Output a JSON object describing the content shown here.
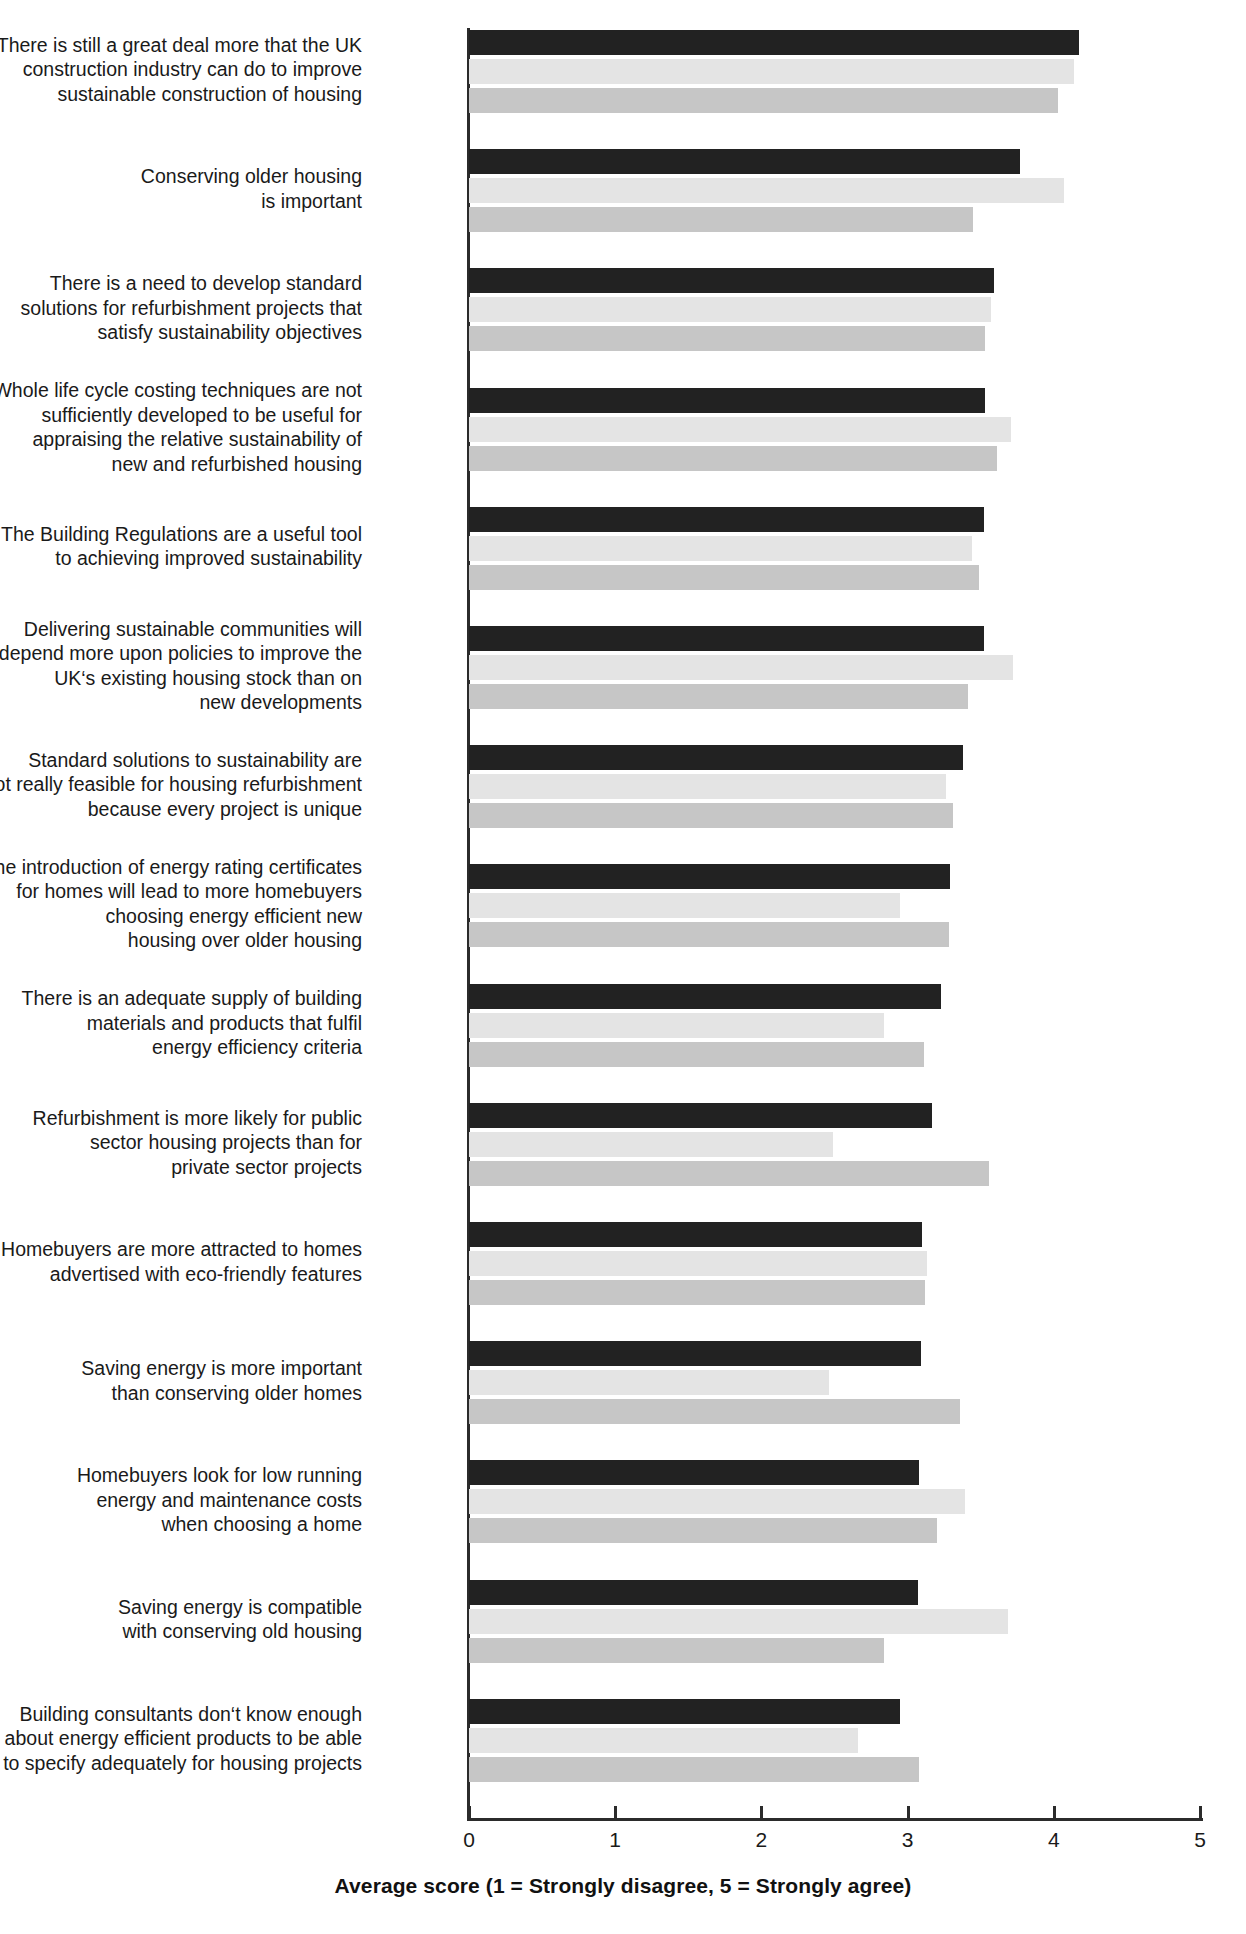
{
  "chart_data": {
    "type": "bar",
    "orientation": "horizontal",
    "title": "",
    "xlabel": "Average score (1 = Strongly disagree, 5 = Strongly agree)",
    "ylabel": "",
    "xlim": [
      0,
      5
    ],
    "xticks": [
      "0",
      "1",
      "2",
      "3",
      "4",
      "5"
    ],
    "grid": false,
    "legend": "none",
    "categories": [
      "There is still a great deal more that the UK\nconstruction industry can do to improve\nsustainable construction of housing",
      "Conserving older housing\nis important",
      "There is a need to develop standard\nsolutions for refurbishment projects that\nsatisfy sustainability objectives",
      "Whole life cycle costing techniques are not\nsufficiently developed to be useful for\nappraising the relative sustainability of\nnew and refurbished housing",
      "The Building Regulations are a useful tool\nto achieving improved sustainability",
      "Delivering sustainable communities will\ndepend more upon policies to improve the\nUK‘s existing housing stock than on\nnew developments",
      "Standard solutions to sustainability are\nnot really feasible for housing refurbishment\nbecause every project is unique",
      "The introduction of energy rating certificates\nfor homes will lead to more homebuyers\nchoosing energy efficient new\nhousing over older housing",
      "There is an adequate supply of building\nmaterials and products that fulfil\nenergy efficiency criteria",
      "Refurbishment is more likely for public\nsector housing projects than for\nprivate sector projects",
      "Homebuyers are more attracted to homes\nadvertised with eco-friendly features",
      "Saving energy is more important\nthan conserving older homes",
      "Homebuyers look for low running\nenergy and maintenance costs\nwhen choosing a home",
      "Saving energy is compatible\nwith conserving old housing",
      "Building consultants don‘t know enough\nabout energy efficient products to be able\nto specify adequately for housing projects"
    ],
    "series": [
      {
        "name": "series-1",
        "color": "#222222",
        "values": [
          4.17,
          3.77,
          3.59,
          3.53,
          3.52,
          3.52,
          3.38,
          3.29,
          3.23,
          3.17,
          3.1,
          3.09,
          3.08,
          3.07,
          2.95
        ]
      },
      {
        "name": "series-2",
        "color": "#e4e4e4",
        "values": [
          4.14,
          4.07,
          3.57,
          3.71,
          3.44,
          3.72,
          3.26,
          2.95,
          2.84,
          2.49,
          3.13,
          2.46,
          3.39,
          3.69,
          2.66
        ]
      },
      {
        "name": "series-3",
        "color": "#c6c6c6",
        "values": [
          4.03,
          3.45,
          3.53,
          3.61,
          3.49,
          3.41,
          3.31,
          3.28,
          3.11,
          3.56,
          3.12,
          3.36,
          3.2,
          2.84,
          3.08
        ]
      }
    ]
  },
  "layout": {
    "axis_origin_x": 469,
    "px_per_unit": 146.2,
    "plot_top": 30,
    "axis_bottom_y": 1818,
    "group_pitch": 119.2,
    "bar_height": 25,
    "bar_gap": 4
  }
}
